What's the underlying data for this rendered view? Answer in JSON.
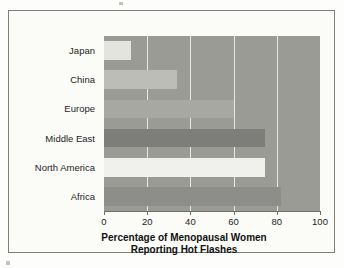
{
  "chart_data": {
    "type": "bar",
    "orientation": "horizontal",
    "title": "Percentage of Menopausal Women Reporting Hot Flashes",
    "title_line1": "Percentage of Menopausal Women",
    "title_line2": "Reporting Hot Flashes",
    "xlabel": "Percentage of Menopausal Women Reporting Hot Flashes",
    "ylabel": "",
    "categories": [
      "Japan",
      "China",
      "Europe",
      "Middle East",
      "North America",
      "Africa"
    ],
    "values": [
      12.5,
      34,
      60,
      74.5,
      74.5,
      82
    ],
    "xlim": [
      0,
      100
    ],
    "xticks": [
      "0",
      "20",
      "40",
      "60",
      "80",
      "100"
    ],
    "xtick_values": [
      0,
      20,
      40,
      60,
      80,
      100
    ],
    "gridlines": [
      20,
      40,
      60,
      80
    ],
    "grid": true,
    "legend": false,
    "bar_colors": [
      "#e4e4df",
      "#bdbdb8",
      "#a8a8a3",
      "#7d7d79",
      "#f0f0ec",
      "#8d8d89"
    ],
    "plot_background": "#9b9b96",
    "gridline_color": "#e9e9e4",
    "axis_color": "#6f6f6a",
    "text_color": "#1d1d1d",
    "figure_background": "#fbfbf8",
    "border_color": "#7c7f78"
  }
}
